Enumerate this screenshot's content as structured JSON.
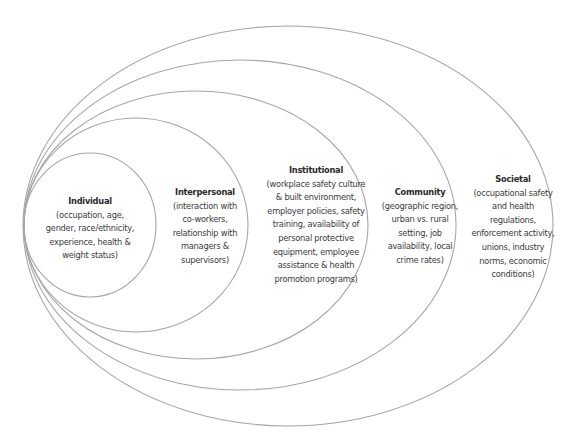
{
  "diagram": {
    "type": "nested-ellipses",
    "stroke_color": "#a6a6a6",
    "levels": [
      {
        "title": "Individual",
        "description": "(occupation, age,\ngender, race/ethnicity,\nexperience, health &\nweight status)",
        "ellipse": {
          "cx": 90,
          "cy": 225,
          "rx": 66,
          "ry": 72
        }
      },
      {
        "title": "Interpersonal",
        "description": "(interaction with\nco-workers,\nrelationship with\nmanagers &\nsupervisors)",
        "ellipse": {
          "cx": 136,
          "cy": 225,
          "rx": 112,
          "ry": 107
        }
      },
      {
        "title": "Institutional",
        "description": "(workplace safety culture\n& built environment,\nemployer policies, safety\ntraining, availability of\npersonal protective\nequipment, employee\nassistance & health\npromotion programs)",
        "ellipse": {
          "cx": 196,
          "cy": 225,
          "rx": 172,
          "ry": 134
        }
      },
      {
        "title": "Community",
        "description": "(geographic region,\nurban vs. rural\nsetting, job\navailability, local\ncrime rates)",
        "ellipse": {
          "cx": 240,
          "cy": 225,
          "rx": 216,
          "ry": 165
        }
      },
      {
        "title": "Societal",
        "description": "(occupational safety\nand health\nregulations,\nenforcement activity,\nunions, industry\nnorms, economic\nconditions)",
        "ellipse": {
          "cx": 288,
          "cy": 226,
          "rx": 265,
          "ry": 200
        }
      }
    ]
  }
}
